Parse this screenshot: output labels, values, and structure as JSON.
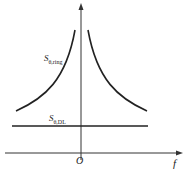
{
  "diagram": {
    "axes": {
      "x_label": "f",
      "origin_label": "O"
    },
    "curves": [
      {
        "name": "S_theta,ring",
        "label_main": "S",
        "label_sub": "θ,ring",
        "shape": "symmetric hyperbolic decay away from f=0"
      },
      {
        "name": "S_theta,DL",
        "label_main": "S",
        "label_sub": "θ,DL",
        "shape": "constant horizontal line"
      }
    ],
    "colors": {
      "line": "#222222",
      "axis": "#333333"
    }
  }
}
